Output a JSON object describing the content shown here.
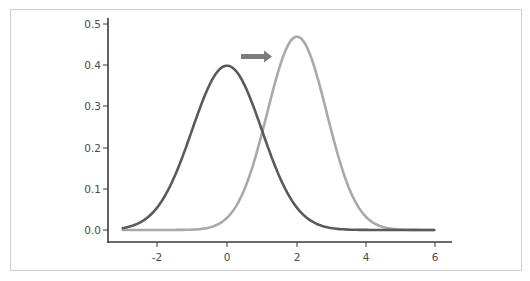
{
  "chart_data": {
    "type": "line",
    "title": "",
    "xlabel": "",
    "ylabel": "",
    "xlim": [
      -3,
      6
    ],
    "ylim": [
      0,
      0.5
    ],
    "grid": false,
    "legend": null,
    "x_ticks": [
      "-2",
      "0",
      "2",
      "4",
      "6"
    ],
    "y_ticks": [
      "0.0",
      "0.1",
      "0.2",
      "0.3",
      "0.4",
      "0.5"
    ],
    "series": [
      {
        "name": "original distribution",
        "color": "#5a5a5a",
        "description": "normal curve, mean 0, sd 1",
        "x": [
          -3,
          -2.5,
          -2,
          -1.5,
          -1,
          -0.5,
          0,
          0.5,
          1,
          1.5,
          2,
          2.5,
          3,
          3.5,
          4,
          5,
          6
        ],
        "y": [
          0.004,
          0.018,
          0.054,
          0.13,
          0.242,
          0.352,
          0.399,
          0.352,
          0.242,
          0.13,
          0.054,
          0.018,
          0.004,
          0.001,
          0.0,
          0.0,
          0.0
        ]
      },
      {
        "name": "shifted distribution",
        "color": "#a9a9a9",
        "description": "normal curve, mean 2, sd ~0.85",
        "x": [
          -3,
          -2,
          -1,
          -0.5,
          0,
          0.5,
          1,
          1.5,
          2,
          2.5,
          3,
          3.5,
          4,
          4.5,
          5,
          6
        ],
        "y": [
          0.0,
          0.0,
          0.0,
          0.001,
          0.03,
          0.097,
          0.234,
          0.393,
          0.469,
          0.393,
          0.234,
          0.097,
          0.03,
          0.006,
          0.001,
          0.0
        ]
      }
    ],
    "annotations": [
      {
        "type": "arrow",
        "direction": "right",
        "color": "#7d7d7d",
        "from_x": 0.4,
        "to_x": 1.3,
        "y": 0.42,
        "meaning": "shift of distribution to the right"
      }
    ]
  },
  "axes": {
    "y_tick_labels": [
      "0.5",
      "0.4",
      "0.3",
      "0.2",
      "0.1",
      "0.0"
    ],
    "x_tick_labels": [
      "-2",
      "0",
      "2",
      "4",
      "6"
    ]
  }
}
